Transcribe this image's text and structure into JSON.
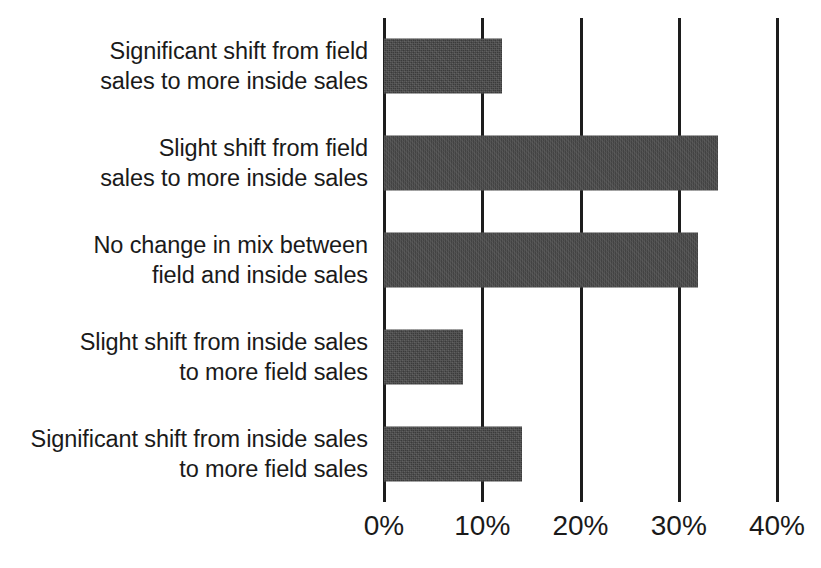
{
  "chart_data": {
    "type": "bar",
    "orientation": "horizontal",
    "title": "",
    "subtitle": "",
    "xlabel": "",
    "ylabel": "",
    "categories": [
      "Significant shift from field\nsales to more inside sales",
      "Slight shift from field\nsales to more inside sales",
      "No change in mix between\nfield and inside sales",
      "Slight shift from inside sales\nto more field sales",
      "Significant shift from inside sales\nto more field sales"
    ],
    "values": [
      12,
      34,
      32,
      8,
      14
    ],
    "value_labels": [
      "12%",
      "34%",
      "32%",
      "8%",
      "14%"
    ],
    "xlim": [
      0,
      40
    ],
    "xticks": [
      0,
      10,
      20,
      30,
      40
    ],
    "xtick_labels": [
      "0%",
      "10%",
      "20%",
      "30%",
      "40%"
    ],
    "grid": true,
    "grid_axis": "x",
    "legend": false,
    "legend_position": "none",
    "bar_color": "#3b3b3b",
    "gridline_color": "#1d1d1d",
    "background_color": "#ffffff",
    "text_color": "#1a1a1a"
  }
}
